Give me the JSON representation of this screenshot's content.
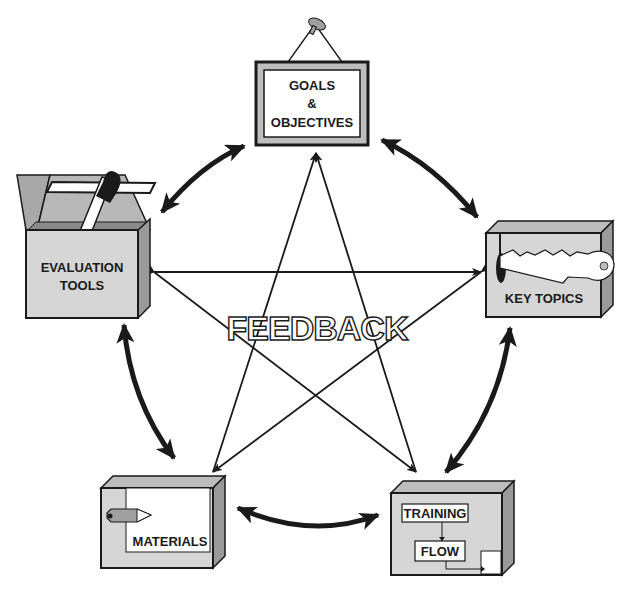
{
  "diagram": {
    "type": "cycle-star",
    "center_label": "FEEDBACK",
    "nodes": [
      {
        "id": "goals",
        "lines": [
          "GOALS",
          "&",
          "OBJECTIVES"
        ],
        "icon": "hanging-sign-icon"
      },
      {
        "id": "key_topics",
        "lines": [
          "KEY TOPICS"
        ],
        "icon": "key-box-icon"
      },
      {
        "id": "training_flow",
        "lines": [
          "TRAINING",
          "FLOW"
        ],
        "icon": "flowchart-box-icon"
      },
      {
        "id": "materials",
        "lines": [
          "MATERIALS"
        ],
        "icon": "pencil-box-icon"
      },
      {
        "id": "evaluation_tools",
        "lines": [
          "EVALUATION",
          "TOOLS"
        ],
        "icon": "open-box-ruler-icon"
      }
    ],
    "cycle_arrows": [
      {
        "from": "goals",
        "to": "key_topics",
        "bidirectional": true
      },
      {
        "from": "key_topics",
        "to": "training_flow",
        "bidirectional": true
      },
      {
        "from": "training_flow",
        "to": "materials",
        "bidirectional": true
      },
      {
        "from": "materials",
        "to": "evaluation_tools",
        "bidirectional": true
      },
      {
        "from": "evaluation_tools",
        "to": "goals",
        "bidirectional": true
      }
    ],
    "star_arrows": [
      {
        "from": "goals",
        "to": "materials"
      },
      {
        "from": "goals",
        "to": "training_flow"
      },
      {
        "from": "evaluation_tools",
        "to": "key_topics"
      },
      {
        "from": "evaluation_tools",
        "to": "training_flow"
      },
      {
        "from": "key_topics",
        "to": "materials"
      }
    ],
    "colors": {
      "line": "#1a1a1a",
      "box_face": "#d6d6d6",
      "box_side": "#9a9a9a",
      "box_top": "#bdbdbd",
      "background": "#ffffff"
    }
  }
}
